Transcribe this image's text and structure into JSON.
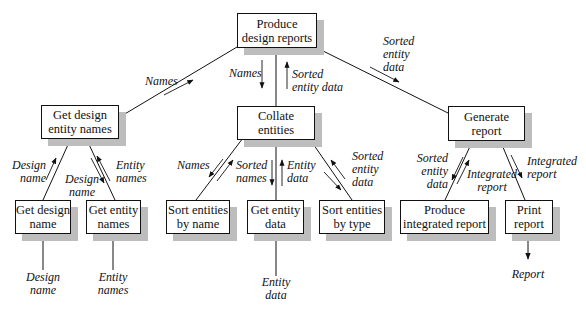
{
  "diagram": {
    "type": "structure-chart",
    "nodes": {
      "root": "Produce\ndesign reports",
      "get_design_entity_names": "Get design\nentity names",
      "collate_entities": "Collate\nentities",
      "generate_report": "Generate\nreport",
      "get_design_name": "Get design\nname",
      "get_entity_names": "Get entity\nnames",
      "sort_by_name": "Sort entities\nby name",
      "get_entity_data": "Get entity\ndata",
      "sort_by_type": "Sort entities\nby type",
      "produce_integrated_report": "Produce\nintegrated report",
      "print_report": "Print\nreport"
    },
    "labels": {
      "names_up_left": "Names",
      "names_down_center": "Names",
      "sorted_entity_data_up_center": "Sorted\nentity data",
      "sorted_entity_data_right": "Sorted\nentity\ndata",
      "design_name_up": "Design\nname",
      "design_name_down": "Design\nname",
      "entity_names_up": "Entity\nnames",
      "names_down_sort": "Names",
      "sorted_names_up": "Sorted\nnames",
      "entity_data_up": "Entity\ndata",
      "sorted_entity_data_from_type": "Sorted\nentity\ndata",
      "sorted_entity_data_to_integrated": "Sorted\nentity\ndata",
      "integrated_report_up": "Integrated\nreport",
      "integrated_report_down": "Integrated\nreport",
      "input_design_name": "Design\nname",
      "input_entity_names": "Entity\nnames",
      "input_entity_data": "Entity\ndata",
      "output_report": "Report"
    },
    "colors": {
      "line": "#111111",
      "shadow": "#bdbdbd",
      "box_fill": "#ffffff"
    }
  }
}
